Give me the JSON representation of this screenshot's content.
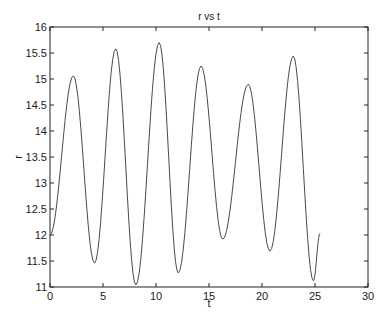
{
  "chart_data": {
    "type": "line",
    "title": "r vs t",
    "xlabel": "t",
    "ylabel": "r",
    "xlim": [
      0,
      30
    ],
    "ylim": [
      11,
      16
    ],
    "xticks": [
      0,
      5,
      10,
      15,
      20,
      25,
      30
    ],
    "yticks": [
      11,
      11.5,
      12,
      12.5,
      13,
      13.5,
      14,
      14.5,
      15,
      15.5,
      16
    ],
    "ytick_labels": [
      "11",
      "11.5",
      "12",
      "12.5",
      "13",
      "13.5",
      "14",
      "14.5",
      "15",
      "15.5",
      "16"
    ],
    "xtick_labels": [
      "0",
      "5",
      "10",
      "15",
      "20",
      "25",
      "30"
    ],
    "grid": false,
    "legend": null,
    "line_color": "#4a4a4a",
    "series": [
      {
        "name": "r",
        "extrema": [
          {
            "t": 0.0,
            "r": 12.0
          },
          {
            "t": 2.2,
            "r": 15.06
          },
          {
            "t": 4.2,
            "r": 11.46
          },
          {
            "t": 6.2,
            "r": 15.58
          },
          {
            "t": 8.1,
            "r": 11.04
          },
          {
            "t": 10.3,
            "r": 15.7
          },
          {
            "t": 12.1,
            "r": 11.27
          },
          {
            "t": 14.25,
            "r": 15.25
          },
          {
            "t": 16.3,
            "r": 11.92
          },
          {
            "t": 18.7,
            "r": 14.9
          },
          {
            "t": 20.75,
            "r": 11.69
          },
          {
            "t": 22.95,
            "r": 15.44
          },
          {
            "t": 24.85,
            "r": 11.12
          },
          {
            "t": 25.47,
            "r": 12.03
          }
        ]
      }
    ]
  },
  "plot": {
    "title": "r vs t",
    "xlabel": "t",
    "ylabel": "r"
  }
}
